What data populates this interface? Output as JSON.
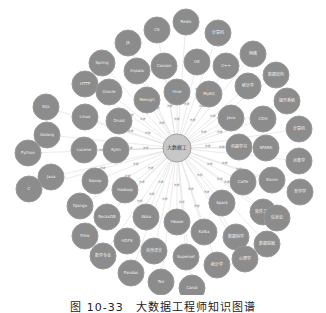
{
  "figure": {
    "caption": "图 10-33　大数据工程师知识图谱",
    "colors": {
      "node_fill": "#8c8c8c",
      "center_fill": "#c8c8c8",
      "edge": "#d4d4d4",
      "background": "#ffffff"
    },
    "center": {
      "label": "大数据工",
      "x": 177,
      "y": 148,
      "r": 14
    },
    "edge_label": "技能",
    "nodes": [
      {
        "label": "JS",
        "x": 128,
        "y": 43
      },
      {
        "label": "CS",
        "x": 157,
        "y": 30
      },
      {
        "label": "Redis",
        "x": 186,
        "y": 22
      },
      {
        "label": "计算机",
        "x": 218,
        "y": 33
      },
      {
        "label": "Spring",
        "x": 102,
        "y": 63
      },
      {
        "label": "Impala",
        "x": 137,
        "y": 71
      },
      {
        "label": "Cassan",
        "x": 164,
        "y": 66
      },
      {
        "label": "OK",
        "x": 197,
        "y": 62
      },
      {
        "label": "C++",
        "x": 226,
        "y": 66
      },
      {
        "label": "网络",
        "x": 253,
        "y": 54
      },
      {
        "label": "HTTP",
        "x": 85,
        "y": 84
      },
      {
        "label": "Oracle",
        "x": 109,
        "y": 92
      },
      {
        "label": "Memgrl",
        "x": 147,
        "y": 100
      },
      {
        "label": "Hive",
        "x": 177,
        "y": 92
      },
      {
        "label": "MySQ",
        "x": 209,
        "y": 94
      },
      {
        "label": "统计学",
        "x": 248,
        "y": 86
      },
      {
        "label": "数据结构",
        "x": 276,
        "y": 75
      },
      {
        "label": "SQL",
        "x": 46,
        "y": 107
      },
      {
        "label": "Linux",
        "x": 85,
        "y": 117
      },
      {
        "label": "Druid",
        "x": 119,
        "y": 121
      },
      {
        "label": "Java",
        "x": 231,
        "y": 118
      },
      {
        "label": "CDH",
        "x": 263,
        "y": 119
      },
      {
        "label": "操作系统",
        "x": 287,
        "y": 101
      },
      {
        "label": "Golang",
        "x": 47,
        "y": 135
      },
      {
        "label": "Lucene",
        "x": 84,
        "y": 150
      },
      {
        "label": "Kylin",
        "x": 116,
        "y": 150
      },
      {
        "label": "机器学习",
        "x": 239,
        "y": 147
      },
      {
        "label": "SPARK",
        "x": 266,
        "y": 148
      },
      {
        "label": "计算机",
        "x": 299,
        "y": 129
      },
      {
        "label": "Python",
        "x": 28,
        "y": 153
      },
      {
        "label": "Java",
        "x": 51,
        "y": 177
      },
      {
        "label": "Sqoop",
        "x": 95,
        "y": 181
      },
      {
        "label": "Hadoop",
        "x": 125,
        "y": 190
      },
      {
        "label": "Caffe",
        "x": 243,
        "y": 182
      },
      {
        "label": "Storm",
        "x": 272,
        "y": 180
      },
      {
        "label": "运筹学",
        "x": 299,
        "y": 161
      },
      {
        "label": "C",
        "x": 29,
        "y": 189
      },
      {
        "label": "Django",
        "x": 80,
        "y": 206
      },
      {
        "label": "RocksDB",
        "x": 107,
        "y": 217
      },
      {
        "label": "Akka",
        "x": 146,
        "y": 217
      },
      {
        "label": "Hbase",
        "x": 177,
        "y": 222
      },
      {
        "label": "Spark",
        "x": 222,
        "y": 203
      },
      {
        "label": "软件工程",
        "x": 263,
        "y": 212
      },
      {
        "label": "哲学学",
        "x": 300,
        "y": 192
      },
      {
        "label": "Flink",
        "x": 85,
        "y": 236
      },
      {
        "label": "HDFS",
        "x": 127,
        "y": 241
      },
      {
        "label": "自然语言",
        "x": 154,
        "y": 251
      },
      {
        "label": "Kafka",
        "x": 204,
        "y": 232
      },
      {
        "label": "数据科学",
        "x": 236,
        "y": 237
      },
      {
        "label": "信息论",
        "x": 277,
        "y": 218
      },
      {
        "label": "数学专业",
        "x": 103,
        "y": 256
      },
      {
        "label": "Superset",
        "x": 186,
        "y": 257
      },
      {
        "label": "数据挖掘",
        "x": 267,
        "y": 244
      },
      {
        "label": "Pandas",
        "x": 131,
        "y": 273
      },
      {
        "label": "Tez",
        "x": 161,
        "y": 282
      },
      {
        "label": "统计学",
        "x": 217,
        "y": 265
      },
      {
        "label": "心理学",
        "x": 245,
        "y": 259
      },
      {
        "label": "Canal",
        "x": 192,
        "y": 288
      }
    ]
  }
}
